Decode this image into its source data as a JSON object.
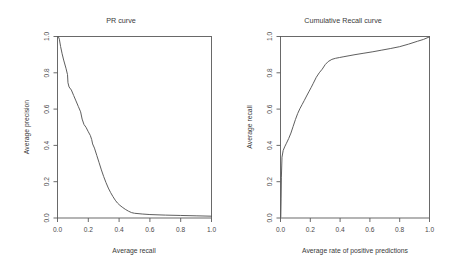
{
  "figure": {
    "background": "#ffffff",
    "axis_color": "#5a5a5a",
    "curve_color": "#555555",
    "text_color": "#3a3a3a"
  },
  "panels": {
    "left": {
      "title": "PR curve",
      "xlabel": "Average recall",
      "ylabel": "Average precision",
      "xticks": [
        "0.0",
        "0.2",
        "0.4",
        "0.6",
        "0.8",
        "1.0"
      ],
      "yticks": [
        "0.0",
        "0.2",
        "0.4",
        "0.6",
        "0.8",
        "1.0"
      ]
    },
    "right": {
      "title": "Cumulative Recall curve",
      "xlabel": "Average rate of positive predictions",
      "ylabel": "Average recall",
      "xticks": [
        "0.0",
        "0.2",
        "0.4",
        "0.6",
        "0.8",
        "1.0"
      ],
      "yticks": [
        "0.0",
        "0.2",
        "0.4",
        "0.6",
        "0.8",
        "1.0"
      ]
    }
  },
  "chart_data": [
    {
      "type": "line",
      "title": "PR curve",
      "xlabel": "Average recall",
      "ylabel": "Average precision",
      "xlim": [
        0.0,
        1.0
      ],
      "ylim": [
        0.0,
        1.0
      ],
      "xticks": [
        0.0,
        0.2,
        0.4,
        0.6,
        0.8,
        1.0
      ],
      "yticks": [
        0.0,
        0.2,
        0.4,
        0.6,
        0.8,
        1.0
      ],
      "grid": false,
      "legend": "none",
      "series": [
        {
          "name": "precision-recall",
          "x": [
            0.005,
            0.012,
            0.02,
            0.03,
            0.04,
            0.055,
            0.065,
            0.068,
            0.075,
            0.09,
            0.105,
            0.12,
            0.135,
            0.15,
            0.16,
            0.172,
            0.185,
            0.2,
            0.213,
            0.222,
            0.228,
            0.24,
            0.255,
            0.27,
            0.285,
            0.3,
            0.315,
            0.33,
            0.345,
            0.36,
            0.375,
            0.39,
            0.405,
            0.42,
            0.44,
            0.46,
            0.48,
            0.5,
            0.55,
            0.6,
            0.7,
            0.8,
            0.9,
            1.0
          ],
          "y": [
            1.0,
            0.985,
            0.945,
            0.905,
            0.87,
            0.825,
            0.79,
            0.745,
            0.722,
            0.705,
            0.675,
            0.645,
            0.615,
            0.585,
            0.545,
            0.515,
            0.5,
            0.475,
            0.455,
            0.432,
            0.408,
            0.385,
            0.345,
            0.305,
            0.265,
            0.228,
            0.195,
            0.165,
            0.14,
            0.118,
            0.098,
            0.082,
            0.07,
            0.06,
            0.048,
            0.038,
            0.03,
            0.026,
            0.022,
            0.019,
            0.016,
            0.014,
            0.012,
            0.01
          ]
        }
      ]
    },
    {
      "type": "line",
      "title": "Cumulative Recall curve",
      "xlabel": "Average rate of positive predictions",
      "ylabel": "Average recall",
      "xlim": [
        0.0,
        1.0
      ],
      "ylim": [
        0.0,
        1.0
      ],
      "xticks": [
        0.0,
        0.2,
        0.4,
        0.6,
        0.8,
        1.0
      ],
      "yticks": [
        0.0,
        0.2,
        0.4,
        0.6,
        0.8,
        1.0
      ],
      "grid": false,
      "legend": "none",
      "series": [
        {
          "name": "cumulative-recall",
          "x": [
            0.002,
            0.004,
            0.006,
            0.01,
            0.018,
            0.028,
            0.04,
            0.055,
            0.07,
            0.085,
            0.1,
            0.115,
            0.13,
            0.145,
            0.16,
            0.175,
            0.19,
            0.205,
            0.22,
            0.24,
            0.26,
            0.28,
            0.3,
            0.32,
            0.345,
            0.37,
            0.395,
            0.42,
            0.46,
            0.5,
            0.56,
            0.62,
            0.68,
            0.74,
            0.8,
            0.86,
            0.92,
            0.96,
            1.0
          ],
          "y": [
            0.005,
            0.105,
            0.225,
            0.335,
            0.372,
            0.392,
            0.412,
            0.438,
            0.468,
            0.505,
            0.542,
            0.575,
            0.602,
            0.625,
            0.648,
            0.672,
            0.695,
            0.718,
            0.742,
            0.775,
            0.8,
            0.82,
            0.845,
            0.862,
            0.874,
            0.88,
            0.884,
            0.888,
            0.894,
            0.9,
            0.908,
            0.916,
            0.925,
            0.934,
            0.944,
            0.958,
            0.974,
            0.984,
            0.998
          ]
        }
      ]
    }
  ]
}
